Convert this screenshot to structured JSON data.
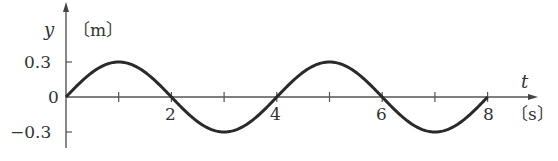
{
  "chart_data": {
    "type": "line",
    "title": "",
    "xlabel": "t",
    "xunit": "〔s〕",
    "ylabel": "y",
    "yunit": "〔m〕",
    "xlim": [
      0,
      8
    ],
    "ylim": [
      -0.3,
      0.3
    ],
    "x_ticks": [
      1,
      2,
      3,
      4,
      5,
      6,
      7,
      8
    ],
    "x_tick_labels": [
      "2",
      "4",
      "6",
      "8"
    ],
    "y_tick_labels": [
      "0.3",
      "0",
      "-0.3"
    ],
    "grid": false,
    "legend": null,
    "series": [
      {
        "name": "y = 0.3 sin(πt/2)",
        "amplitude": 0.3,
        "period": 4,
        "x": [
          0,
          1,
          2,
          3,
          4,
          5,
          6,
          7,
          8
        ],
        "values": [
          0,
          0.3,
          0,
          -0.3,
          0,
          0.3,
          0,
          -0.3,
          0
        ]
      }
    ]
  },
  "labels": {
    "y_axis": "y",
    "y_unit": "〔m〕",
    "t_axis": "t",
    "t_unit": "〔s〕",
    "y_pos": "0.3",
    "y_zero": "0",
    "y_neg": "−0.3",
    "x2": "2",
    "x4": "4",
    "x6": "6",
    "x8": "8"
  },
  "colors": {
    "axis": "#555555",
    "curve": "#2a2a2a"
  }
}
